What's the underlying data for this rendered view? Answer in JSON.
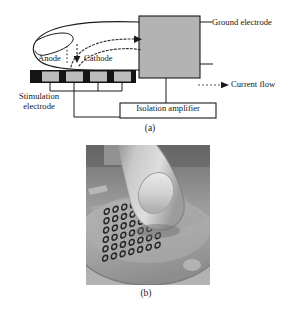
{
  "figure": {
    "panel_a": {
      "caption": "(a)",
      "labels": {
        "ground_electrode": "Ground electrode",
        "current_flow": "Current flow",
        "anode": "Anode",
        "cathode": "Cathode",
        "stimulation_electrode_line1": "Stimulation",
        "stimulation_electrode_line2": "electrode",
        "isolation_amplifier": "Isolation amplifier"
      },
      "electrode_pad_count": 4,
      "colors": {
        "ground_box_fill": "#b3b3b3",
        "ground_box_stroke": "#1a1a1a",
        "electrode_substrate": "#141414",
        "electrode_pad": "#b8b8b8",
        "line": "#1a1a1a",
        "dashed_current": "#3a3a3a",
        "background": "#ffffff"
      }
    },
    "panel_b": {
      "caption": "(b)",
      "description": "fingertip pressing on a flexible electrode array mounted on a round base",
      "electrode_array_rows": 6,
      "electrode_array_cols": 7,
      "colors": {
        "photo_background": "#a8a8a8",
        "base_plate": "#9c9c9c",
        "substrate": "#a5a5a5",
        "finger": "#c6c6c6",
        "electrode_ring": "#2b2b2b"
      }
    }
  }
}
